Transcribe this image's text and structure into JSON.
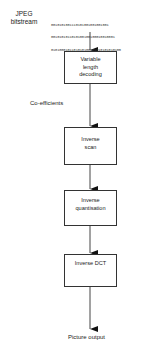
{
  "diagram": {
    "input_label": "JPEG bitstream",
    "input_label_lines": [
      "JPEG",
      "bitstream"
    ],
    "bitstream_lines": [
      "0010101001110101001001001001",
      "0010101011010100100100010010001",
      "0101000101101010100101010101010100"
    ],
    "edge_label_coefficients": "Co-efficients",
    "nodes": [
      {
        "id": "vld",
        "label_lines": [
          "Variable",
          "length",
          "decoding"
        ]
      },
      {
        "id": "iscan",
        "label_lines": [
          "Inverse",
          "scan"
        ]
      },
      {
        "id": "iquant",
        "label_lines": [
          "Inverse",
          "quantisation"
        ]
      },
      {
        "id": "idct",
        "label_lines": [
          "Inverse DCT"
        ]
      }
    ],
    "output_label": "Picture output",
    "colors": {
      "line": "#333333",
      "background": "#ffffff"
    }
  }
}
